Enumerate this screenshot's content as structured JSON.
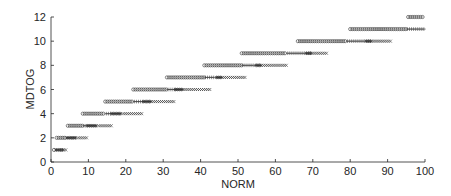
{
  "chart_data": {
    "type": "scatter",
    "title": "",
    "xlabel": "NORM",
    "ylabel": "MDTOG",
    "xlim": [
      0,
      100
    ],
    "ylim": [
      0,
      12
    ],
    "xticks": [
      0,
      10,
      20,
      30,
      40,
      50,
      60,
      70,
      80,
      90,
      100
    ],
    "yticks": [
      0,
      2,
      4,
      6,
      8,
      10,
      12
    ],
    "grid": false,
    "legend": null,
    "marker_types": [
      "circle (o)",
      "plus (+)",
      "filled/overlap (*)",
      "cross (x)"
    ],
    "note": "Points are stacked horizontally per integer MDTOG level; each row transitions from circles to plus, then filled, then x markers. Marker counts and type breakpoints are estimated from the visual extent of each row, not counted individually.",
    "rows": [
      {
        "y": 1,
        "x_start": 0.8,
        "x_end": 4.2,
        "segments": [
          {
            "marker": "o",
            "from": 0.8,
            "to": 1.2
          },
          {
            "marker": "*",
            "from": 1.4,
            "to": 3.2
          },
          {
            "marker": "x",
            "from": 3.4,
            "to": 4.2
          }
        ]
      },
      {
        "y": 2,
        "x_start": 1.5,
        "x_end": 9.5,
        "segments": [
          {
            "marker": "o",
            "from": 1.5,
            "to": 4.0
          },
          {
            "marker": "*",
            "from": 4.3,
            "to": 7.0
          },
          {
            "marker": "x",
            "from": 7.3,
            "to": 9.5
          }
        ]
      },
      {
        "y": 3,
        "x_start": 4.5,
        "x_end": 16.5,
        "segments": [
          {
            "marker": "o",
            "from": 4.5,
            "to": 8.5
          },
          {
            "marker": "+",
            "from": 8.8,
            "to": 9.5
          },
          {
            "marker": "*",
            "from": 9.8,
            "to": 12.5
          },
          {
            "marker": "x",
            "from": 12.8,
            "to": 16.5
          }
        ]
      },
      {
        "y": 4,
        "x_start": 8.5,
        "x_end": 24.5,
        "segments": [
          {
            "marker": "o",
            "from": 8.5,
            "to": 14.5
          },
          {
            "marker": "+",
            "from": 14.8,
            "to": 16.0
          },
          {
            "marker": "*",
            "from": 16.3,
            "to": 19.0
          },
          {
            "marker": "x",
            "from": 19.3,
            "to": 24.5
          }
        ]
      },
      {
        "y": 5,
        "x_start": 14.5,
        "x_end": 33.0,
        "segments": [
          {
            "marker": "o",
            "from": 14.5,
            "to": 22.0
          },
          {
            "marker": "+",
            "from": 22.3,
            "to": 24.5
          },
          {
            "marker": "*",
            "from": 24.8,
            "to": 26.5
          },
          {
            "marker": "x",
            "from": 26.8,
            "to": 33.0
          }
        ]
      },
      {
        "y": 6,
        "x_start": 22.0,
        "x_end": 42.5,
        "segments": [
          {
            "marker": "o",
            "from": 22.0,
            "to": 31.0
          },
          {
            "marker": "+",
            "from": 31.3,
            "to": 33.0
          },
          {
            "marker": "*",
            "from": 33.3,
            "to": 35.0
          },
          {
            "marker": "x",
            "from": 35.3,
            "to": 42.5
          }
        ]
      },
      {
        "y": 7,
        "x_start": 31.0,
        "x_end": 52.0,
        "segments": [
          {
            "marker": "o",
            "from": 31.0,
            "to": 41.0
          },
          {
            "marker": "+",
            "from": 41.3,
            "to": 44.0
          },
          {
            "marker": "*",
            "from": 44.3,
            "to": 45.5
          },
          {
            "marker": "x",
            "from": 45.8,
            "to": 52.0
          }
        ]
      },
      {
        "y": 8,
        "x_start": 41.0,
        "x_end": 63.0,
        "segments": [
          {
            "marker": "o",
            "from": 41.0,
            "to": 51.0
          },
          {
            "marker": "+",
            "from": 51.3,
            "to": 54.5
          },
          {
            "marker": "*",
            "from": 54.8,
            "to": 56.0
          },
          {
            "marker": "x",
            "from": 56.3,
            "to": 63.0
          }
        ]
      },
      {
        "y": 9,
        "x_start": 51.0,
        "x_end": 74.0,
        "segments": [
          {
            "marker": "o",
            "from": 51.0,
            "to": 63.0
          },
          {
            "marker": "+",
            "from": 63.3,
            "to": 68.0
          },
          {
            "marker": "*",
            "from": 68.3,
            "to": 69.5
          },
          {
            "marker": "x",
            "from": 69.8,
            "to": 74.0
          }
        ]
      },
      {
        "y": 10,
        "x_start": 66.0,
        "x_end": 91.0,
        "segments": [
          {
            "marker": "o",
            "from": 66.0,
            "to": 79.0
          },
          {
            "marker": "+",
            "from": 79.3,
            "to": 84.0
          },
          {
            "marker": "*",
            "from": 84.3,
            "to": 85.5
          },
          {
            "marker": "x",
            "from": 85.8,
            "to": 91.0
          }
        ]
      },
      {
        "y": 11,
        "x_start": 80.0,
        "x_end": 100.0,
        "segments": [
          {
            "marker": "o",
            "from": 80.0,
            "to": 95.0
          },
          {
            "marker": "+",
            "from": 95.3,
            "to": 100.0
          }
        ]
      },
      {
        "y": 12,
        "x_start": 95.5,
        "x_end": 99.5,
        "segments": [
          {
            "marker": "o",
            "from": 95.5,
            "to": 99.5
          }
        ]
      }
    ]
  },
  "axes": {
    "xlabel": "NORM",
    "ylabel": "MDTOG",
    "xtick_labels": [
      "0",
      "10",
      "20",
      "30",
      "40",
      "50",
      "60",
      "70",
      "80",
      "90",
      "100"
    ],
    "ytick_labels": [
      "0",
      "2",
      "4",
      "6",
      "8",
      "10",
      "12"
    ]
  },
  "colors": {
    "axis": "#262626",
    "marker": "#333333",
    "background": "#ffffff"
  }
}
